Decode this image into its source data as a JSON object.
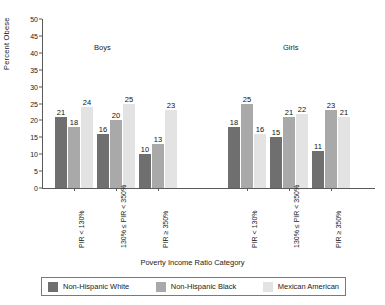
{
  "chart_data": {
    "type": "bar",
    "title": "",
    "xlabel": "Poverty Income Ratio Category",
    "ylabel": "Percent Obese",
    "ylim": [
      0,
      50
    ],
    "ytick_step": 5,
    "yticks": [
      "50",
      "45",
      "40",
      "35",
      "30",
      "25",
      "20",
      "15",
      "10",
      "5",
      "0"
    ],
    "grid": false,
    "legend_position": "bottom",
    "legend": [
      "Non-Hispanic White",
      "Non-Hispanic Black",
      "Mexican American"
    ],
    "colors": [
      "#6f6f6f",
      "#a9a9a9",
      "#e3e3e3"
    ],
    "panels": [
      "Boys",
      "Girls"
    ],
    "categories": [
      "PIR < 130%",
      "130% ≤ PIR < 350%",
      "PIR ≥ 350%",
      "PIR < 130%",
      "130% ≤ PIR < 350%",
      "PIR ≥ 350%"
    ],
    "series": [
      {
        "name": "Non-Hispanic White",
        "values": [
          21,
          16,
          10,
          18,
          15,
          11
        ]
      },
      {
        "name": "Non-Hispanic Black",
        "values": [
          18,
          20,
          13,
          25,
          21,
          23
        ]
      },
      {
        "name": "Mexican American",
        "values": [
          24,
          25,
          23,
          16,
          22,
          21
        ]
      }
    ],
    "groups": [
      {
        "panel": "Boys",
        "category": "PIR < 130%",
        "values": [
          21,
          18,
          24
        ]
      },
      {
        "panel": "Boys",
        "category": "130% ≤ PIR < 350%",
        "values": [
          16,
          20,
          25
        ]
      },
      {
        "panel": "Boys",
        "category": "PIR ≥ 350%",
        "values": [
          10,
          13,
          23
        ]
      },
      {
        "panel": "Girls",
        "category": "PIR < 130%",
        "values": [
          18,
          25,
          16
        ]
      },
      {
        "panel": "Girls",
        "category": "130% ≤ PIR < 350%",
        "values": [
          15,
          21,
          22
        ]
      },
      {
        "panel": "Girls",
        "category": "PIR ≥ 350%",
        "values": [
          11,
          23,
          21
        ]
      }
    ]
  },
  "panel_titles": {
    "boys": "Boys",
    "girls": "Girls"
  },
  "axis": {
    "ylabel": "Percent Obese",
    "xlabel": "Poverty Income Ratio Category"
  },
  "legend": {
    "items": [
      {
        "label": "Non-Hispanic White",
        "color": "#6f6f6f"
      },
      {
        "label": "Non-Hispanic Black",
        "color": "#a9a9a9"
      },
      {
        "label": "Mexican American",
        "color": "#e3e3e3"
      }
    ]
  }
}
